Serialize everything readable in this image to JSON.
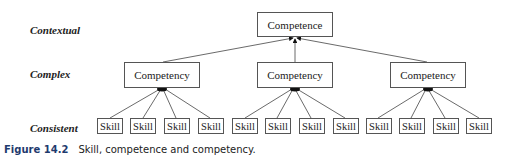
{
  "levels": [
    "Contextual",
    "Complex",
    "Consistent"
  ],
  "top": {
    "label": "Competence"
  },
  "middle": [
    {
      "label": "Competency",
      "skills": [
        "Skill",
        "Skill",
        "Skill",
        "Skill"
      ]
    },
    {
      "label": "Competency",
      "skills": [
        "Skill",
        "Skill",
        "Skill",
        "Skill"
      ]
    },
    {
      "label": "Competency",
      "skills": [
        "Skill",
        "Skill",
        "Skill",
        "Skill"
      ]
    }
  ],
  "caption": {
    "number": "Figure 14.2",
    "text": "Skill, competence and competency."
  }
}
